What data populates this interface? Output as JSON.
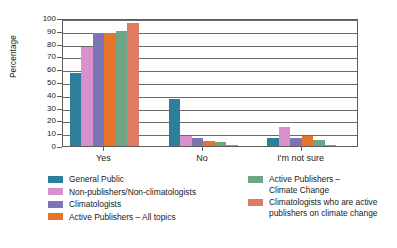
{
  "chart_data": {
    "type": "bar",
    "title": "",
    "subtitle": "",
    "xlabel": "",
    "ylabel": "Percentage",
    "categories": [
      "Yes",
      "No",
      "I'm not sure"
    ],
    "ylim": [
      0,
      100
    ],
    "yticks": [
      0,
      10,
      20,
      30,
      40,
      50,
      60,
      70,
      80,
      90,
      100
    ],
    "ytick_labels": [
      "0",
      "10",
      "20",
      "30",
      "40",
      "50",
      "60",
      "70",
      "80",
      "90",
      "100"
    ],
    "grid": true,
    "grid_axis": "y",
    "legend_position": "below",
    "legend_columns": 2,
    "series": [
      {
        "name": "General Public",
        "color": "#2E7F9B",
        "values": [
          57,
          37,
          6
        ]
      },
      {
        "name": "Non-publishers/Non-climatologists",
        "color": "#D991CD",
        "values": [
          77,
          8,
          15
        ]
      },
      {
        "name": "Climatologists",
        "color": "#7B74B6",
        "values": [
          88,
          6,
          6
        ]
      },
      {
        "name": "Active Publishers – All topics",
        "color": "#E8742B",
        "values": [
          88,
          4,
          7.5
        ]
      },
      {
        "name": "Active Publishers –\nClimate Change",
        "color": "#6FA587",
        "values": [
          90,
          3.5,
          5
        ]
      },
      {
        "name": "Climatologists who are active\npublishers on climate change",
        "color": "#E07B63",
        "values": [
          96,
          0.5,
          0.5
        ]
      }
    ]
  }
}
